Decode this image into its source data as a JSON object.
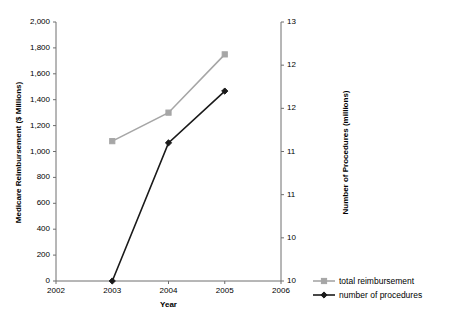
{
  "chart_data": {
    "type": "line",
    "title": "",
    "xlabel": "Year",
    "ylabel": "Medicare Reimbursement ($ Millions)",
    "y2label": "Number of Procedures (millions)",
    "x": [
      2003,
      2004,
      2005
    ],
    "xlim": [
      2002,
      2006
    ],
    "xticks": [
      "2002",
      "2003",
      "2004",
      "2005",
      "2006"
    ],
    "ylim": [
      0,
      2000
    ],
    "yticks": [
      "0",
      "200",
      "400",
      "600",
      "800",
      "1,000",
      "1,200",
      "1,400",
      "1,600",
      "1,800",
      "2,000"
    ],
    "y2lim": [
      10,
      13
    ],
    "y2ticks": [
      "10",
      "10",
      "11",
      "11",
      "12",
      "12",
      "13"
    ],
    "grid": false,
    "legend_position": "bottom-right-outside",
    "series": [
      {
        "name": "total reimbursement",
        "axis": "left",
        "color": "#a6a6a6",
        "marker": "square",
        "values": [
          1080,
          1300,
          1750
        ]
      },
      {
        "name": "number of procedures",
        "axis": "right",
        "color": "#1a1a1a",
        "marker": "diamond",
        "values": [
          10.0,
          11.6,
          12.2
        ]
      }
    ]
  },
  "legend": {
    "items": [
      {
        "label": "total reimbursement"
      },
      {
        "label": "number of procedures"
      }
    ]
  },
  "axes": {
    "x_title": "Year",
    "y_left_title": "Medicare Reimbursement ($ Millions)",
    "y_right_title": "Number of Procedures (millions)"
  }
}
